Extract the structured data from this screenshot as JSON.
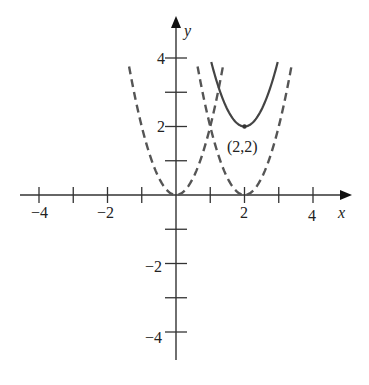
{
  "chart_data": {
    "type": "line",
    "title": "",
    "xlabel": "x",
    "ylabel": "y",
    "xlim": [
      -4.5,
      5
    ],
    "ylim": [
      -4.8,
      5.2
    ],
    "grid": false,
    "x_ticks": [
      -4,
      -3,
      -2,
      -1,
      1,
      2,
      3,
      4
    ],
    "x_tick_labels": [
      "-4",
      "-2",
      "2",
      "4"
    ],
    "x_tick_label_values": [
      -4,
      -2,
      2,
      4
    ],
    "y_ticks": [
      -4,
      -3,
      -2,
      -1,
      1,
      2,
      3,
      4
    ],
    "y_tick_labels": [
      "4",
      "2",
      "-2",
      "-4"
    ],
    "y_tick_label_values": [
      4,
      2,
      -2,
      -4
    ],
    "series": [
      {
        "name": "y = 2x^2",
        "style": "dashed",
        "color": "#555555",
        "a": 2,
        "h": 0,
        "k": 0,
        "x_range": [
          -1.37,
          1.37
        ]
      },
      {
        "name": "y = 2(x-2)^2",
        "style": "dashed",
        "color": "#555555",
        "a": 2,
        "h": 2,
        "k": 0,
        "x_range": [
          0.63,
          3.37
        ]
      },
      {
        "name": "y = 2(x-2)^2 + 2",
        "style": "solid",
        "color": "#444444",
        "a": 2,
        "h": 2,
        "k": 2,
        "x_range": [
          1.03,
          2.97
        ]
      }
    ],
    "annotations": [
      {
        "text": "(2,2)",
        "x": 2,
        "y": 2,
        "marker": "dot"
      }
    ]
  },
  "labels": {
    "x_axis": "x",
    "y_axis": "y",
    "vertex": "(2,2)",
    "xt_m4": "−4",
    "xt_m2": "−2",
    "xt_2": "2",
    "xt_4": "4",
    "yt_4": "4",
    "yt_2": "2",
    "yt_m2": "−2",
    "yt_m4": "−4"
  }
}
